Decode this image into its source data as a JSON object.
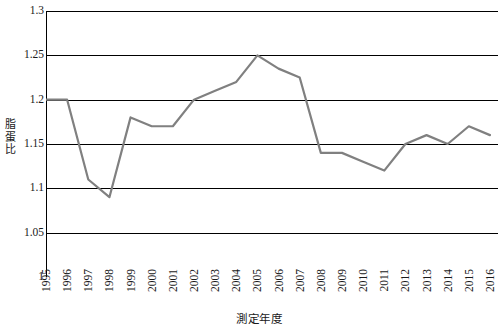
{
  "chart_data": {
    "type": "line",
    "title": "",
    "xlabel": "測定年度",
    "ylabel": "脂蛋比",
    "categories": [
      "1995",
      "1996",
      "1997",
      "1998",
      "1999",
      "2000",
      "2001",
      "2002",
      "2003",
      "2004",
      "2005",
      "2006",
      "2007",
      "2008",
      "2009",
      "2010",
      "2011",
      "2012",
      "2013",
      "2014",
      "2015",
      "2016"
    ],
    "values": [
      1.2,
      1.2,
      1.11,
      1.09,
      1.18,
      1.17,
      1.17,
      1.2,
      1.21,
      1.22,
      1.25,
      1.235,
      1.225,
      1.14,
      1.14,
      1.13,
      1.12,
      1.15,
      1.16,
      1.15,
      1.17,
      1.16
    ],
    "series": [
      {
        "name": "脂蛋比",
        "values": [
          1.2,
          1.2,
          1.11,
          1.09,
          1.18,
          1.17,
          1.17,
          1.2,
          1.21,
          1.22,
          1.25,
          1.235,
          1.225,
          1.14,
          1.14,
          1.13,
          1.12,
          1.15,
          1.16,
          1.15,
          1.17,
          1.16
        ]
      }
    ],
    "ylim": [
      1,
      1.3
    ],
    "yticks": [
      1,
      1.05,
      1.1,
      1.15,
      1.2,
      1.25,
      1.3
    ],
    "ytick_labels": [
      "1",
      "1.05",
      "1.1",
      "1.15",
      "1.2",
      "1.25",
      "1.3"
    ],
    "grid": true,
    "grid_axis": "y",
    "legend": false,
    "legend_position": "none",
    "line_color": "#808080",
    "grid_color": "#000000",
    "background_color": "#ffffff",
    "markers": false
  },
  "axes": {
    "y_title": "脂蛋比",
    "x_title": "測定年度"
  }
}
